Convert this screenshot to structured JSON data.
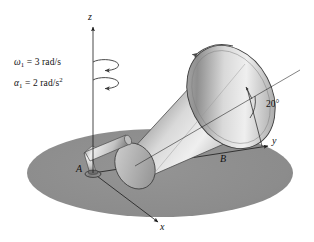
{
  "figure": {
    "background_color": "#ffffff",
    "ground_color": "#8c8c8c",
    "cone_color_light": "#e8e8e8",
    "cone_color_dark": "#8e8e8e",
    "line_color": "#1a1a1a"
  },
  "axes": {
    "z_label": "z",
    "y_label": "y",
    "x_label": "x"
  },
  "points": {
    "A": "A",
    "B": "B"
  },
  "annotations": {
    "omega": {
      "symbol": "ω",
      "subscript": "1",
      "equals": " = ",
      "value": "3 rad/s"
    },
    "alpha": {
      "symbol": "α",
      "subscript": "1",
      "equals": " = ",
      "value": "2 rad/s",
      "superscript": "2"
    },
    "cone_angle": "20°"
  }
}
